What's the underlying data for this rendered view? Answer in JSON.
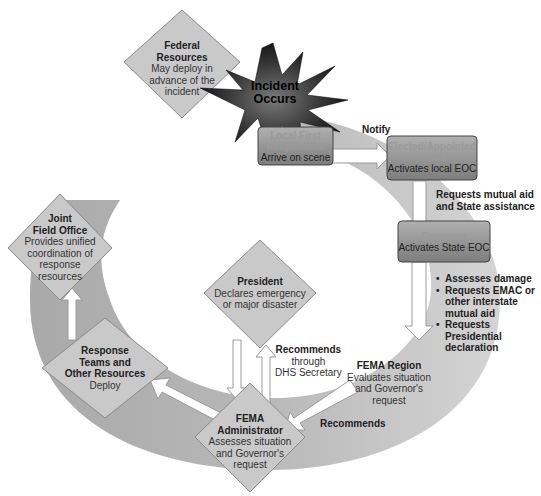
{
  "diagram": {
    "type": "incident-response-flow-cycle",
    "colors": {
      "ring": "#c4c4c4",
      "ring_dark": "#a8a8a8",
      "diamond_fill": "#c8c8c8",
      "box_fill": "#8e8e8e",
      "burst_dark": "#1a1a1a",
      "arrow_fill": "#ffffff",
      "arrow_stroke": "#9a9a9a"
    },
    "incident": {
      "line1": "Incident",
      "line2": "Occurs"
    },
    "nodes": {
      "federal_resources": {
        "title_line1": "Federal",
        "title_line2": "Resources",
        "body_line1": "May deploy in",
        "body_line2": "advance of the",
        "body_line3": "incident"
      },
      "local_first_responders": {
        "title_line1": "Local First",
        "title_line2": "Responders",
        "body": "Arrive on scene"
      },
      "elected_official": {
        "title_line1": "Elected/Appointed",
        "title_line2": "Official",
        "body": "Activates local EOC"
      },
      "governor": {
        "title": "Governor",
        "body": "Activates State EOC"
      },
      "fema_region": {
        "title": "FEMA Region",
        "body_line1": "Evaluates situation",
        "body_line2": "and Governor's",
        "body_line3": "request"
      },
      "fema_administrator": {
        "title_line1": "FEMA",
        "title_line2": "Administrator",
        "body_line1": "Assesses situation",
        "body_line2": "and Governor's",
        "body_line3": "request"
      },
      "president": {
        "title": "President",
        "body_line1": "Declares emergency",
        "body_line2": "or major disaster"
      },
      "response_teams": {
        "title_line1": "Response",
        "title_line2": "Teams and",
        "title_line3": "Other Resources",
        "body": "Deploy"
      },
      "joint_field_office": {
        "title_line1": "Joint",
        "title_line2": "Field Office",
        "body_line1": "Provides unified",
        "body_line2": "coordination of",
        "body_line3": "response",
        "body_line4": "resources"
      }
    },
    "edge_labels": {
      "notify": "Notify",
      "requests_mutual_aid_line1": "Requests mutual aid",
      "requests_mutual_aid_line2": "and State assistance",
      "governor_actions": [
        "Assesses damage",
        "Requests EMAC or other interstate mutual aid",
        "Requests Presidential declaration"
      ],
      "governor_actions_lines": {
        "a1": "Assesses damage",
        "b1": "Requests EMAC or",
        "b2": "other interstate",
        "b3": "mutual aid",
        "c1": "Requests",
        "c2": "Presidential",
        "c3": "declaration"
      },
      "recommends_bottom": "Recommends",
      "recommends_through_line1": "Recommends",
      "recommends_through_line2": "through",
      "recommends_through_line3": "DHS Secretary"
    }
  }
}
